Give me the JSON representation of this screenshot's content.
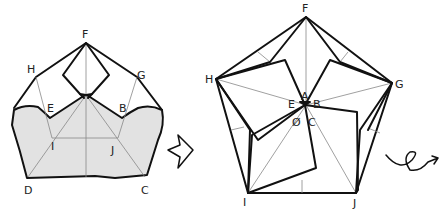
{
  "diagram": {
    "left_figure": {
      "labels": {
        "F": "F",
        "H": "H",
        "G": "G",
        "E": "E",
        "B": "B",
        "I": "I",
        "J": "J",
        "D": "D",
        "C": "C"
      }
    },
    "arrow": {
      "icon": "hollow-right-arrow"
    },
    "right_figure": {
      "labels": {
        "F": "F",
        "H": "H",
        "G": "G",
        "A": "A",
        "E": "E",
        "B": "B",
        "D": "Ø",
        "C": "C",
        "I": "I",
        "J": "J"
      }
    },
    "turn_over_symbol": {
      "icon": "loop-arrow"
    },
    "colors": {
      "line": "#111111",
      "crease": "#888888",
      "shade": "#e2e2e2"
    }
  }
}
